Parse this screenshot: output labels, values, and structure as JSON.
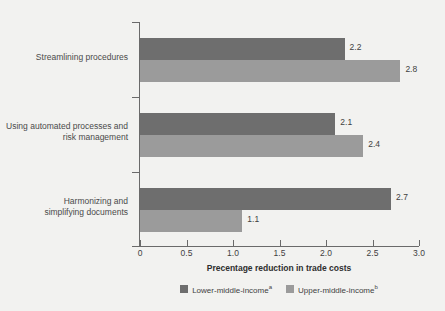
{
  "chart_data": {
    "type": "bar",
    "orientation": "horizontal",
    "title": "",
    "xlabel": "Precentage reduction in trade costs",
    "ylabel": "",
    "xlim": [
      0,
      3.0
    ],
    "xticks": [
      "0",
      "0.5",
      "1.0",
      "1.5",
      "2.0",
      "2.5",
      "3.0"
    ],
    "xtick_values": [
      0,
      0.5,
      1.0,
      1.5,
      2.0,
      2.5,
      3.0
    ],
    "grid": false,
    "legend_position": "bottom-center",
    "categories": [
      "Streamlining procedures",
      "Using automated processes and\nrisk management",
      "Harmonizing and\nsimplifying documents"
    ],
    "series": [
      {
        "name": "Lower-middle-income",
        "footnote_marker": "a",
        "color": "#6e6e6e",
        "values": [
          2.2,
          2.1,
          2.7
        ],
        "value_labels": [
          "2.2",
          "2.1",
          "2.7"
        ]
      },
      {
        "name": "Upper-middle-income",
        "footnote_marker": "b",
        "color": "#9b9b9b",
        "values": [
          2.8,
          2.4,
          1.1
        ],
        "value_labels": [
          "2.8",
          "2.4",
          "1.1"
        ]
      }
    ]
  },
  "legend": {
    "items": [
      {
        "label": "Lower-middle-income",
        "marker": "a"
      },
      {
        "label": "Upper-middle-income",
        "marker": "b"
      }
    ]
  },
  "colors": {
    "background": "#f2f2f0",
    "axis": "#6a6a6a",
    "text": "#3f3f3f",
    "lower_middle_income": "#6e6e6e",
    "upper_middle_income": "#9b9b9b"
  }
}
